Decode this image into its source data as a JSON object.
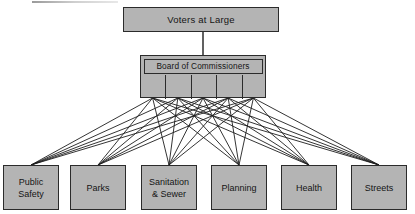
{
  "diagram": {
    "type": "organization-chart",
    "title_node": {
      "label": "Voters at Large"
    },
    "board": {
      "label": "Board of Commissioners",
      "seat_count": 5,
      "seats": [
        "",
        "",
        "",
        "",
        ""
      ]
    },
    "departments": [
      {
        "label": "Public\nSafety"
      },
      {
        "label": "Parks"
      },
      {
        "label": "Sanitation\n& Sewer"
      },
      {
        "label": "Planning"
      },
      {
        "label": "Health"
      },
      {
        "label": "Streets"
      }
    ],
    "colors": {
      "box_fill": "#b4b4b4",
      "box_border": "#2b2b2b",
      "connector": "#1e1e1e",
      "background": "#ffffff"
    },
    "connections": {
      "voters_to_board": 1,
      "board_seats_to_departments": "full-mesh",
      "total_mesh_lines": 30
    }
  }
}
